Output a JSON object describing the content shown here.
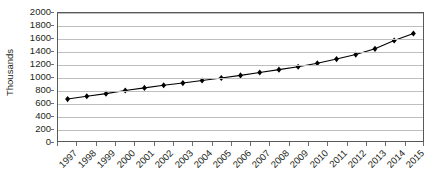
{
  "chart_data": {
    "type": "line",
    "title": "",
    "xlabel": "",
    "ylabel": "Thousands",
    "categories": [
      "1997",
      "1998",
      "1999",
      "2000",
      "2001",
      "2002",
      "2003",
      "2004",
      "2005",
      "2006",
      "2007",
      "2008",
      "2009",
      "2010",
      "2011",
      "2012",
      "2013",
      "2014",
      "2015"
    ],
    "values": [
      655,
      700,
      740,
      790,
      830,
      870,
      905,
      945,
      985,
      1025,
      1070,
      1115,
      1160,
      1215,
      1280,
      1350,
      1440,
      1570,
      1680
    ],
    "series": [
      {
        "name": "Thousands",
        "values": [
          655,
          700,
          740,
          790,
          830,
          870,
          905,
          945,
          985,
          1025,
          1070,
          1115,
          1160,
          1215,
          1280,
          1350,
          1440,
          1570,
          1680
        ]
      }
    ],
    "ylim": [
      0,
      2000
    ],
    "ytick_values": [
      0,
      200,
      400,
      600,
      800,
      1000,
      1200,
      1400,
      1600,
      1800,
      2000
    ],
    "ytick_labels": [
      "0",
      "200",
      "400",
      "600",
      "800",
      "1000",
      "1200",
      "1400",
      "1600",
      "1800",
      "2000"
    ],
    "grid": true,
    "grid_axis": "y",
    "legend": false,
    "legend_position": "none",
    "marker": "diamond",
    "marker_color": "#000000",
    "line_color": "#000000",
    "grid_color": "#bcbec0",
    "axis_color": "#58595b",
    "text_color": "#231f20",
    "background": "#ffffff",
    "xtick_label_rotation": -45
  }
}
